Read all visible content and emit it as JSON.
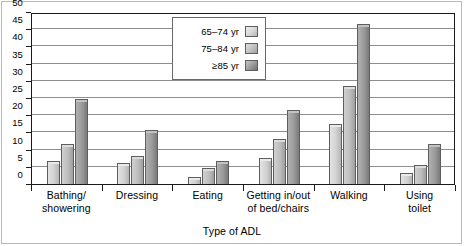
{
  "chart_data": {
    "type": "bar",
    "title": "",
    "xlabel": "Type of ADL",
    "ylabel": "",
    "ylim": [
      0,
      50
    ],
    "ytick_step": 5,
    "yticks": [
      0,
      5,
      10,
      15,
      20,
      25,
      30,
      35,
      40,
      45,
      50
    ],
    "grid": true,
    "legend_position": "top-center",
    "categories": [
      "Bathing/\nshowering",
      "Dressing",
      "Eating",
      "Getting in/out\nof bed/chairs",
      "Walking",
      "Using\ntoilet"
    ],
    "series": [
      {
        "name": "65–74 yr",
        "values": [
          6,
          5.5,
          1.5,
          7,
          17,
          2.5
        ],
        "color": "#d6d6d6"
      },
      {
        "name": "75–84 yr",
        "values": [
          11,
          7.5,
          4,
          12.5,
          28,
          5
        ],
        "color": "#bdbdbd"
      },
      {
        "name": "≥85 yr",
        "values": [
          24,
          15,
          6,
          21,
          46,
          11
        ],
        "color": "#9a9a9a"
      }
    ]
  },
  "legend": {
    "items": [
      {
        "label": "65–74 yr"
      },
      {
        "label": "75–84 yr"
      },
      {
        "label": "≥85 yr"
      }
    ]
  },
  "axis": {
    "x_title": "Type of ADL"
  }
}
